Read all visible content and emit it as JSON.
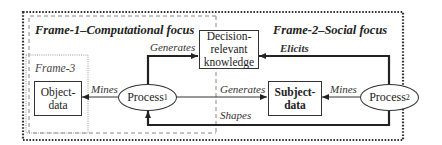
{
  "frames": {
    "frame1": {
      "title": "Frame-1–Computational focus",
      "border": "dashed"
    },
    "frame2": {
      "title": "Frame-2–Social focus",
      "border": "dotted"
    },
    "frame3": {
      "title": "Frame-3",
      "border": "dotted-light"
    }
  },
  "nodes": {
    "object_data": {
      "label": "Object-\ndata",
      "line1": "Object-",
      "line2": "data",
      "shape": "rectangle"
    },
    "decision_knowledge": {
      "line1": "Decision-",
      "line2": "relevant",
      "line3": "knowledge",
      "shape": "rectangle"
    },
    "subject_data": {
      "line1": "Subject-",
      "line2": "data",
      "shape": "rectangle",
      "bold": true
    },
    "process1": {
      "label": "Process",
      "subscript": "1",
      "shape": "ellipse"
    },
    "process2": {
      "label": "Process",
      "subscript": "2",
      "shape": "ellipse"
    }
  },
  "edges": [
    {
      "id": "p1_mines_object",
      "from": "process1",
      "to": "object_data",
      "label": "Mines"
    },
    {
      "id": "p1_generates_decision",
      "from": "process1",
      "to": "decision_knowledge",
      "label": "Generates",
      "weight": "bold"
    },
    {
      "id": "p1_generates_subject",
      "from": "process1",
      "to": "subject_data",
      "label": "Generates"
    },
    {
      "id": "p2_elicits_decision",
      "from": "process2",
      "to": "decision_knowledge",
      "label": "Elicits",
      "weight": "bold"
    },
    {
      "id": "p2_mines_subject",
      "from": "process2",
      "to": "subject_data",
      "label": "Mines"
    },
    {
      "id": "p2_shapes_p1",
      "from": "process2",
      "to": "process1",
      "label": "Shapes",
      "weight": "bold"
    }
  ],
  "colors": {
    "stroke": "#333333",
    "text": "#222222",
    "frame3": "#888888",
    "background": "#ffffff"
  }
}
